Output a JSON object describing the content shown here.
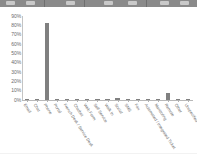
{
  "toolbar": {
    "name": "application-toolbar-strip",
    "visible_fragment": true
  },
  "chart_data": {
    "type": "bar",
    "title": "",
    "subtitle": "",
    "xlabel": "",
    "ylabel": "",
    "ylim": [
      0,
      0.9
    ],
    "grid": false,
    "legend": false,
    "legend_position": "none",
    "bar_color": "#808080",
    "axis_color": "#b8b8b8",
    "tick_label_color": "#6b6b6b",
    "value_format": "percent",
    "ytick_labels": [
      "90%",
      "80%",
      "70%",
      "60%",
      "50%",
      "40%",
      "30%",
      "20%",
      "10%",
      "0%"
    ],
    "ytick_values": [
      0.9,
      0.8,
      0.7,
      0.6,
      0.5,
      0.4,
      0.3,
      0.2,
      0.1,
      0.0
    ],
    "categories": [
      "Email",
      "Chat",
      "Phone",
      "Portal",
      "French Desk / Service Desk",
      "Chatbot",
      "Web Form",
      "Self Service",
      "Walk In",
      "Social",
      "SMS",
      "Fax",
      "Automated / Integrated Ticket",
      "Monitoring",
      "Remote",
      "Other",
      "Unspecified"
    ],
    "values": [
      0.005,
      0.005,
      0.82,
      0.005,
      0.005,
      0.005,
      0.005,
      0.005,
      0.005,
      0.02,
      0.005,
      0.012,
      0.005,
      0.005,
      0.07,
      0.005,
      0.005
    ]
  }
}
